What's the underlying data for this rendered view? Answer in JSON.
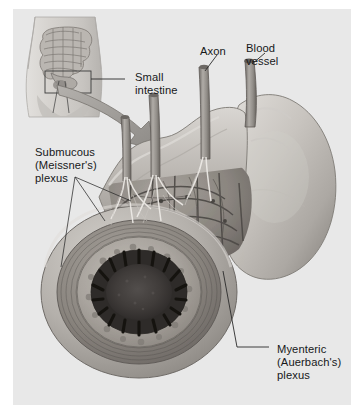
{
  "figure": {
    "type": "anatomical-illustration",
    "style": "grayscale medical illustration",
    "panel": {
      "background_color": "#e8e8e8",
      "page_background_color": "#ffffff"
    },
    "labels": [
      {
        "id": "small-intestine",
        "name": "small-intestine-label",
        "lines": [
          "Small",
          "intestine"
        ],
        "text": "Small intestine",
        "points_to": "inset-torso-callout-box"
      },
      {
        "id": "axon",
        "name": "axon-label",
        "lines": [
          "Axon"
        ],
        "text": "Axon",
        "points_to": "nerve-stalk"
      },
      {
        "id": "blood-vessel",
        "name": "blood-vessel-label",
        "lines": [
          "Blood",
          "vessel"
        ],
        "text": "Blood vessel",
        "points_to": "vessel-stalk"
      },
      {
        "id": "submucous-plexus",
        "name": "submucous-plexus-label",
        "lines": [
          "Submucous",
          "(Meissner's)",
          "plexus"
        ],
        "text": "Submucous (Meissner's) plexus",
        "points_to": "submucosa-layer"
      },
      {
        "id": "myenteric-plexus",
        "name": "myenteric-plexus-label",
        "lines": [
          "Myenteric",
          "(Auerbach's)",
          "plexus"
        ],
        "text": "Myenteric (Auerbach's) plexus",
        "points_to": "muscularis-nerve-network"
      }
    ],
    "inset": {
      "name": "torso-inset",
      "description": "human torso outline with intestines and callout box"
    },
    "arrow": {
      "name": "magnification-arrow",
      "description": "curved arrow from torso inset to enlarged intestine view",
      "color": "#9b9b9b"
    },
    "colors": {
      "text": "#17181a",
      "panel": "#e8e8e8",
      "leader_line": "#2a2a2a",
      "serosa": "#b9b6b2",
      "muscle": "#8e8a86",
      "submucosa": "#a9a5a0",
      "lumen": "#3a3736",
      "villi": "#201e1d",
      "vessel": "#9c9894"
    }
  }
}
